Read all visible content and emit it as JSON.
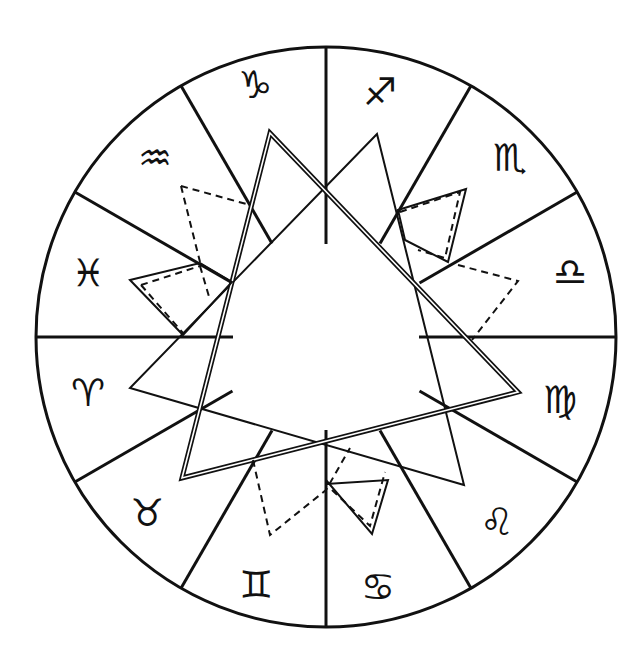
{
  "diagram": {
    "center": [
      326,
      337
    ],
    "radius": 290,
    "colors": {
      "stroke": "#111111",
      "background": "#ffffff"
    },
    "signs": [
      {
        "name": "Sagittarius",
        "symbol": "♐",
        "pos": [
          380,
          92
        ]
      },
      {
        "name": "Scorpio",
        "symbol": "♏",
        "pos": [
          510,
          158
        ]
      },
      {
        "name": "Libra",
        "symbol": "♎",
        "pos": [
          570,
          272
        ]
      },
      {
        "name": "Virgo",
        "symbol": "♍",
        "pos": [
          560,
          400
        ]
      },
      {
        "name": "Leo",
        "symbol": "♌",
        "pos": [
          497,
          522
        ]
      },
      {
        "name": "Cancer",
        "symbol": "♋",
        "pos": [
          378,
          587
        ]
      },
      {
        "name": "Gemini",
        "symbol": "♊",
        "pos": [
          256,
          585
        ]
      },
      {
        "name": "Taurus",
        "symbol": "♉",
        "pos": [
          147,
          513
        ]
      },
      {
        "name": "Aries",
        "symbol": "♈",
        "pos": [
          88,
          393
        ]
      },
      {
        "name": "Pisces",
        "symbol": "♓",
        "pos": [
          88,
          273
        ]
      },
      {
        "name": "Aquarius",
        "symbol": "♒",
        "pos": [
          155,
          158
        ]
      },
      {
        "name": "Capricorn",
        "symbol": "♑",
        "pos": [
          255,
          85
        ]
      }
    ],
    "spoke_angles_deg": [
      0,
      30,
      60,
      90,
      120,
      150,
      180,
      210,
      240,
      270,
      300,
      330
    ],
    "spoke_inner_radius": {
      "axis": 93,
      "diagonal": 108
    },
    "shapes": {
      "solid_triangle": [
        [
          377,
          134
        ],
        [
          130,
          388
        ],
        [
          464,
          485
        ]
      ],
      "double_triangle": [
        [
          270,
          133
        ],
        [
          182,
          478
        ],
        [
          518,
          392
        ]
      ],
      "solid_quads": [
        [
          [
            130,
            280
          ],
          [
            200,
            263
          ],
          [
            232,
            282
          ],
          [
            183,
            335
          ]
        ],
        [
          [
            398,
            210
          ],
          [
            466,
            189
          ],
          [
            448,
            262
          ],
          [
            405,
            240
          ]
        ],
        [
          [
            326,
            484
          ],
          [
            388,
            480
          ],
          [
            372,
            534
          ],
          [
            326,
            480
          ]
        ]
      ],
      "dashed_paths": [
        [
          [
            181,
            186
          ],
          [
            250,
            205
          ]
        ],
        [
          [
            181,
            186
          ],
          [
            200,
            262
          ]
        ],
        [
          [
            141,
            285
          ],
          [
            200,
            266
          ]
        ],
        [
          [
            141,
            285
          ],
          [
            183,
            333
          ]
        ],
        [
          [
            200,
            266
          ],
          [
            210,
            300
          ]
        ],
        [
          [
            400,
            212
          ],
          [
            460,
            192
          ],
          [
            445,
            258
          ],
          [
            418,
            250
          ]
        ],
        [
          [
            458,
            265
          ],
          [
            518,
            281
          ],
          [
            472,
            340
          ]
        ],
        [
          [
            253,
            460
          ],
          [
            270,
            535
          ],
          [
            326,
            490
          ],
          [
            350,
            448
          ]
        ],
        [
          [
            332,
            490
          ],
          [
            370,
            526
          ],
          [
            385,
            472
          ]
        ]
      ]
    }
  }
}
